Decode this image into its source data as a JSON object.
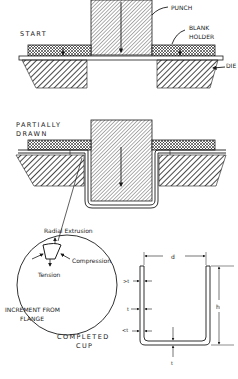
{
  "figure": {
    "stages": [
      {
        "id": "start",
        "label": "START"
      },
      {
        "id": "partial",
        "label_line1": "PARTIALLY",
        "label_line2": "DRAWN"
      },
      {
        "id": "completed",
        "label_line1": "COMPLETED",
        "label_line2": "CUP"
      }
    ],
    "parts": {
      "punch": "PUNCH",
      "blank_holder_line1": "BLANK",
      "blank_holder_line2": "HOLDER",
      "die": "DIE"
    },
    "increment": {
      "title_line1": "INCREMENT FROM",
      "title_line2": "FLANGE",
      "radial": "Radial Extrusion",
      "compression": "Compression",
      "tension": "Tension"
    },
    "cup_dims": {
      "diameter": "d",
      "height": "h",
      "top_wall": ">t",
      "mid_wall": "t",
      "bottom_wall": "<t",
      "base": "t"
    },
    "colors": {
      "ink": "#1a1a1a",
      "background": "#ffffff"
    }
  }
}
